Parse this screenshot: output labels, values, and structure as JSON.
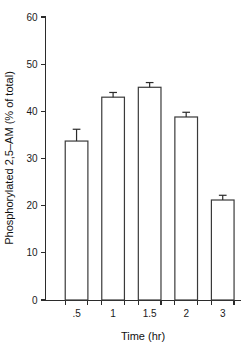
{
  "chart_data": {
    "type": "bar",
    "title": "",
    "subtitle": "",
    "xlabel": "Time (hr)",
    "ylabel": "Phosphorylated 2,5–AM (% of total)",
    "categories": [
      ".5",
      "1",
      "1.5",
      "2",
      "3"
    ],
    "values": [
      33.7,
      43.0,
      45.1,
      38.8,
      21.2
    ],
    "errors": [
      2.5,
      1.0,
      1.0,
      1.0,
      1.0
    ],
    "error_type": "error-bar-upper-cap",
    "ylim": [
      0,
      60
    ],
    "yticks": [
      0,
      10,
      20,
      30,
      40,
      50,
      60
    ],
    "ytick_labels": [
      "0",
      "10",
      "20",
      "30",
      "40",
      "50",
      "60"
    ],
    "grid": false,
    "legend": false,
    "legend_position": "none",
    "bar_fill": "#ffffff",
    "bar_edge_color": "#3a3a3a",
    "axis_color": "#2b2b2b",
    "background": "#ffffff"
  },
  "figure": {
    "y_axis_title": "Phosphorylated 2,5–AM (% of total)",
    "x_axis_title": "Time (hr)"
  }
}
